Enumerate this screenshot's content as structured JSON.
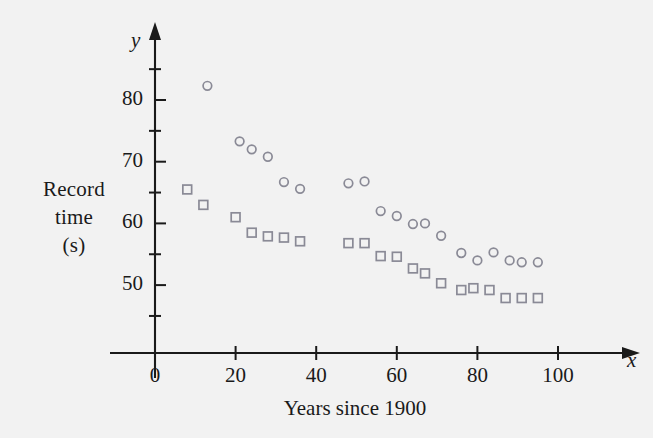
{
  "figure": {
    "background_color": "#f2f2f2",
    "ink_color": "#1a1a1a",
    "marker_color": "#8a8a96"
  },
  "axis": {
    "y_var_label": "y",
    "x_var_label": "x",
    "y_title_lines": [
      "Record",
      "time",
      "(s)"
    ],
    "x_title": "Years since 1900"
  },
  "chart_data": {
    "type": "scatter",
    "title": "",
    "xlabel": "Years since 1900",
    "ylabel": "Record time (s)",
    "xlim": [
      -4,
      112
    ],
    "ylim": [
      43,
      87
    ],
    "xticks": [
      0,
      20,
      40,
      60,
      80,
      100
    ],
    "xtick_labels": [
      "0",
      "20",
      "40",
      "60",
      "80",
      "100"
    ],
    "x_minor_ticks": [
      10,
      30,
      50,
      70,
      90
    ],
    "yticks": [
      50,
      60,
      70,
      80
    ],
    "ytick_labels": [
      "50",
      "60",
      "70",
      "80"
    ],
    "y_minor_ticks": [
      45,
      55,
      65,
      75,
      85
    ],
    "grid": false,
    "legend": "none",
    "series": [
      {
        "name": "circle-series",
        "marker": "circle",
        "points": [
          [
            13,
            82.3
          ],
          [
            21,
            73.3
          ],
          [
            24,
            72.0
          ],
          [
            28,
            70.8
          ],
          [
            32,
            66.7
          ],
          [
            36,
            65.6
          ],
          [
            48,
            66.5
          ],
          [
            52,
            66.8
          ],
          [
            56,
            62.0
          ],
          [
            60,
            61.2
          ],
          [
            64,
            59.9
          ],
          [
            67,
            60.0
          ],
          [
            71,
            58.0
          ],
          [
            76,
            55.2
          ],
          [
            80,
            54.0
          ],
          [
            84,
            55.3
          ],
          [
            88,
            54.0
          ],
          [
            91,
            53.7
          ],
          [
            95,
            53.7
          ]
        ]
      },
      {
        "name": "square-series",
        "marker": "square",
        "points": [
          [
            8,
            65.5
          ],
          [
            12,
            63.0
          ],
          [
            20,
            61.0
          ],
          [
            24,
            58.5
          ],
          [
            28,
            57.9
          ],
          [
            32,
            57.7
          ],
          [
            36,
            57.1
          ],
          [
            48,
            56.8
          ],
          [
            52,
            56.8
          ],
          [
            56,
            54.7
          ],
          [
            60,
            54.6
          ],
          [
            64,
            52.7
          ],
          [
            67,
            51.9
          ],
          [
            71,
            50.3
          ],
          [
            76,
            49.2
          ],
          [
            79,
            49.5
          ],
          [
            83,
            49.2
          ],
          [
            87,
            47.9
          ],
          [
            91,
            47.9
          ],
          [
            95,
            47.9
          ]
        ]
      }
    ]
  }
}
